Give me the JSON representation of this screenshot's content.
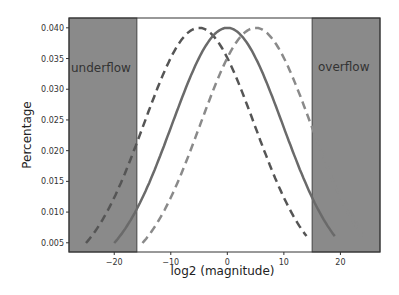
{
  "chart_data": {
    "type": "line",
    "title": "",
    "xlabel": "log2 (magnitude)",
    "ylabel": "Percentage",
    "xlim": [
      -28,
      27
    ],
    "ylim": [
      0.0035,
      0.0416
    ],
    "grid": false,
    "legend": null,
    "x_ticks": [
      -20,
      -10,
      0,
      10,
      20
    ],
    "x_tick_labels": [
      "−20",
      "−10",
      "0",
      "10",
      "20"
    ],
    "y_ticks": [
      0.005,
      0.01,
      0.015,
      0.02,
      0.025,
      0.03,
      0.035,
      0.04
    ],
    "y_tick_labels": [
      "0.005",
      "0.010",
      "0.015",
      "0.020",
      "0.025",
      "0.030",
      "0.035",
      "0.040"
    ],
    "shaded_regions": [
      {
        "name": "underflow",
        "x_from": -28,
        "x_to": -16,
        "color": "#8a8a8a"
      },
      {
        "name": "overflow",
        "x_from": 15,
        "x_to": 27,
        "color": "#8a8a8a"
      }
    ],
    "series": [
      {
        "name": "shifted-left",
        "style": "dashed",
        "color": "#555555",
        "mean": -5,
        "peak": 0.04,
        "x_range": [
          -25,
          14
        ]
      },
      {
        "name": "center",
        "style": "solid",
        "color": "#6a6a6a",
        "mean": 0,
        "peak": 0.04,
        "x_range": [
          -20,
          19
        ]
      },
      {
        "name": "shifted-right",
        "style": "dashed",
        "color": "#8a8a8a",
        "mean": 5,
        "peak": 0.04,
        "x_range": [
          -15,
          24
        ]
      }
    ],
    "endpoint_value": 0.0055
  },
  "labels": {
    "underflow": "underflow",
    "overflow": "overflow"
  }
}
